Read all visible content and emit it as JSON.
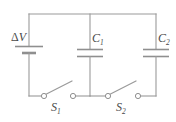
{
  "figure": {
    "background_color": "#ffffff",
    "line_color": "#9a9a9a",
    "text_color": "#4a4a4a",
    "width": 176,
    "height": 122
  },
  "components": {
    "battery": {
      "name": "battery",
      "label_delta": "Δ",
      "label_symbol": "V",
      "label_text": "ΔV",
      "position": {
        "x": 29,
        "y": 50
      }
    },
    "capacitor1": {
      "name": "capacitor-1",
      "label_symbol": "C",
      "label_subscript": "1",
      "label_text": "C1",
      "position": {
        "x": 90,
        "y": 53
      }
    },
    "capacitor2": {
      "name": "capacitor-2",
      "label_symbol": "C",
      "label_subscript": "2",
      "label_text": "C2",
      "position": {
        "x": 156,
        "y": 53
      }
    },
    "switch1": {
      "name": "switch-1",
      "label_symbol": "S",
      "label_subscript": "1",
      "label_text": "S1",
      "state": "open",
      "position": {
        "x": 58,
        "y": 96
      }
    },
    "switch2": {
      "name": "switch-2",
      "label_symbol": "S",
      "label_subscript": "2",
      "label_text": "S2",
      "state": "open",
      "position": {
        "x": 122,
        "y": 96
      }
    }
  },
  "nodes": {
    "top_rail_y": 14,
    "bottom_rail_y": 96,
    "left_branch_x": 29,
    "middle_branch_x": 90,
    "right_branch_x": 156
  }
}
